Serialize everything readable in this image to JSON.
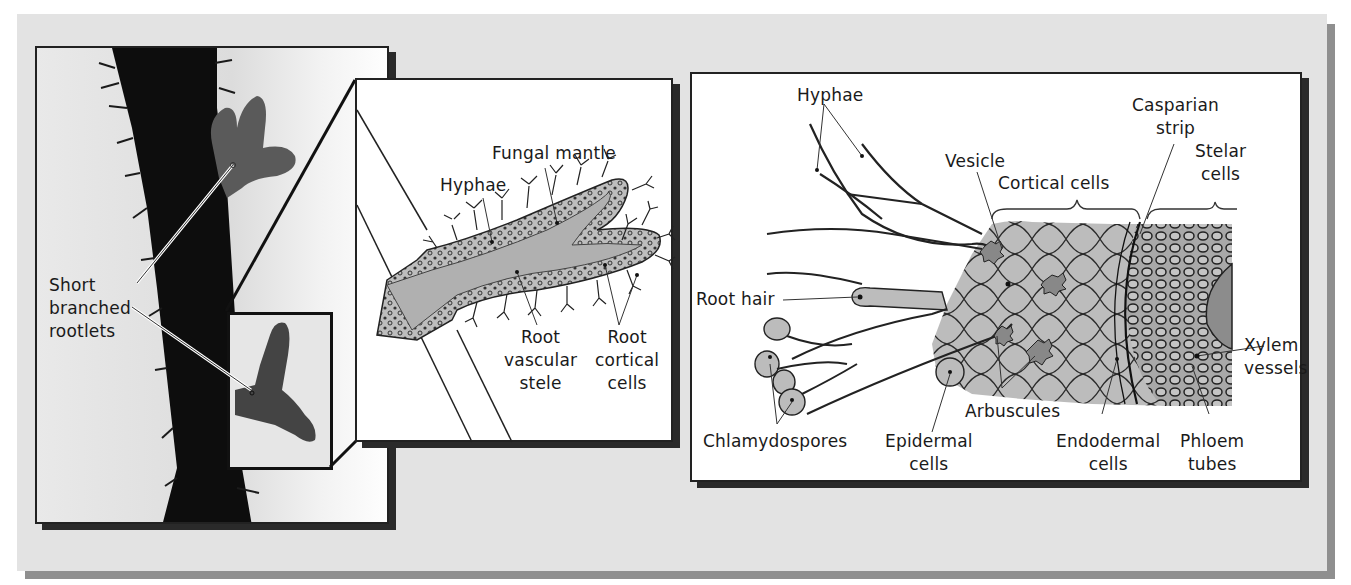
{
  "figure": {
    "panels": [
      {
        "id": "photo",
        "description": "Photograph of root with short branched rootlets (ectomycorrhizae)",
        "labels": [
          "Short",
          "branched",
          "rootlets"
        ]
      },
      {
        "id": "ectomycorrhiza",
        "labels": {
          "fungal_mantle": "Fungal mantle",
          "hyphae": "Hyphae",
          "root_vascular_stele": [
            "Root",
            "vascular",
            "stele"
          ],
          "root_cortical_cells": [
            "Root",
            "cortical",
            "cells"
          ]
        }
      },
      {
        "id": "arbuscular",
        "labels": {
          "hyphae": "Hyphae",
          "vesicle": "Vesicle",
          "cortical_cells": "Cortical cells",
          "casparian_strip": [
            "Casparian",
            "strip"
          ],
          "stelar_cells": [
            "Stelar",
            "cells"
          ],
          "root_hair": "Root hair",
          "xylem_vessels": [
            "Xylem",
            "vessels"
          ],
          "chlamydospores": "Chlamydospores",
          "epidermal_cells": [
            "Epidermal",
            "cells"
          ],
          "arbuscules": "Arbuscules",
          "endodermal_cells": [
            "Endodermal",
            "cells"
          ],
          "phloem_tubes": [
            "Phloem",
            "tubes"
          ]
        }
      }
    ],
    "colors": {
      "backdrop": "#e3e3e3",
      "shadow": "#8f8f8f",
      "tissue_fill": "#b8b8b8",
      "outline": "#222222"
    }
  }
}
